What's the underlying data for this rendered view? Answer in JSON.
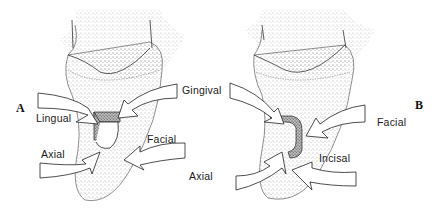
{
  "figure": {
    "panels": [
      {
        "id": "A",
        "label": "A",
        "wall_labels": {
          "gingival": "Gingival",
          "lingual": "Lingual",
          "axial": "Axial",
          "facial": "Facial"
        }
      },
      {
        "id": "B",
        "label": "B",
        "wall_labels": {
          "axial": "Axial",
          "facial": "Facial",
          "incisal": "Incisal"
        }
      }
    ],
    "colors": {
      "ink": "#1a1a1a",
      "stipple": "#555555",
      "background": "#ffffff"
    }
  }
}
